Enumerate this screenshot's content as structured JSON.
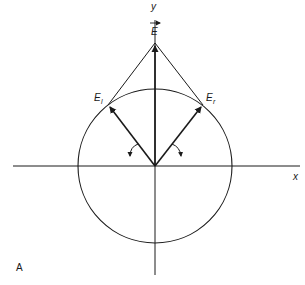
{
  "diagram": {
    "panel_label": "A",
    "axes": {
      "x_label": "x",
      "y_label": "y"
    },
    "vectors": {
      "resultant": {
        "label": "E",
        "has_arrow_over": true
      },
      "left": {
        "label": "E",
        "subscript": "l"
      },
      "right": {
        "label": "E",
        "subscript": "r"
      }
    },
    "colors": {
      "stroke": "#1a1a1a",
      "background": "#ffffff"
    }
  }
}
